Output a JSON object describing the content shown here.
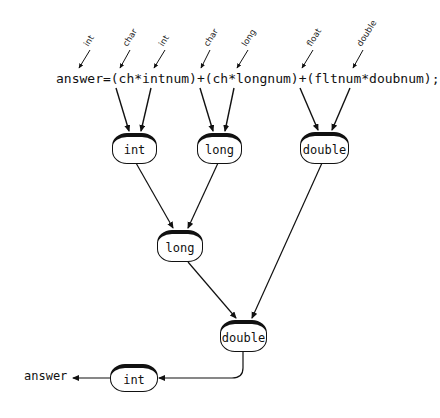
{
  "expression": "answer=(ch*intnum)+(ch*longnum)+(fltnum*doubnum);",
  "operand_types": [
    {
      "label": "int",
      "target": "answer"
    },
    {
      "label": "char",
      "target": "ch"
    },
    {
      "label": "int",
      "target": "intnum"
    },
    {
      "label": "char",
      "target": "ch"
    },
    {
      "label": "long",
      "target": "longnum"
    },
    {
      "label": "float",
      "target": "fltnum"
    },
    {
      "label": "double",
      "target": "doubnum"
    }
  ],
  "nodes": {
    "mul1": {
      "label": "int"
    },
    "mul2": {
      "label": "long"
    },
    "mul3": {
      "label": "double"
    },
    "add1": {
      "label": "long"
    },
    "add2": {
      "label": "double"
    },
    "assign": {
      "label": "int"
    }
  },
  "result": {
    "label": "answer"
  },
  "colors": {
    "stroke": "#111111",
    "background": "#ffffff"
  }
}
